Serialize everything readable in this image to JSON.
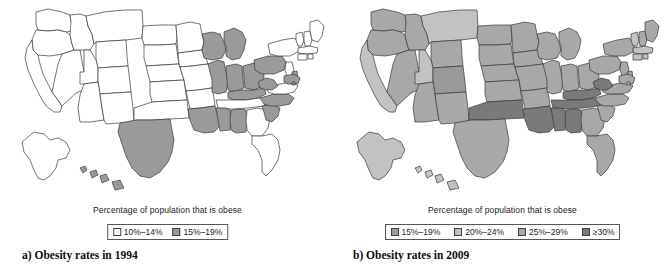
{
  "figure": {
    "panels": [
      {
        "id": "1994",
        "legend_title": "Percentage of population that is obese",
        "caption": "a) Obesity rates in 1994",
        "legend": [
          {
            "label": "10%–14%",
            "color": "#ffffff"
          },
          {
            "label": "15%–19%",
            "color": "#9a9a9a"
          }
        ]
      },
      {
        "id": "2009",
        "legend_title": "Percentage of population that is obese",
        "caption": "b) Obesity rates in 2009",
        "legend": [
          {
            "label": "15%–19%",
            "color": "#9a9a9a"
          },
          {
            "label": "20%–24%",
            "color": "#c2c2c2"
          },
          {
            "label": "25%–29%",
            "color": "#a8a8a8"
          },
          {
            "label": "≥30%",
            "color": "#7a7a7a"
          }
        ]
      }
    ]
  },
  "chart_data": {
    "type": "heatmap",
    "subtitle": "Choropleth maps of percentage of population that is obese",
    "xlabel": "",
    "ylabel": "",
    "grid": false,
    "legend_position": "below-map",
    "maps": [
      {
        "name": "a) Obesity rates in 1994",
        "year": 1994,
        "legend_title": "Percentage of population that is obese",
        "bins": [
          {
            "label": "10%–14%",
            "color": "#ffffff",
            "min": 10,
            "max": 14
          },
          {
            "label": "15%–19%",
            "color": "#9a9a9a",
            "min": 15,
            "max": 19
          }
        ],
        "values": {
          "AL": "15%–19%",
          "AK": "10%–14%",
          "AZ": "10%–14%",
          "AR": "10%–14%",
          "CA": "10%–14%",
          "CO": "10%–14%",
          "CT": "10%–14%",
          "DE": "15%–19%",
          "FL": "10%–14%",
          "GA": "10%–14%",
          "HI": "15%–19%",
          "ID": "10%–14%",
          "IL": "15%–19%",
          "IN": "15%–19%",
          "IA": "10%–14%",
          "KS": "10%–14%",
          "KY": "15%–19%",
          "LA": "15%–19%",
          "ME": "10%–14%",
          "MD": "15%–19%",
          "MA": "10%–14%",
          "MI": "15%–19%",
          "MN": "10%–14%",
          "MS": "15%–19%",
          "MO": "10%–14%",
          "MT": "10%–14%",
          "NE": "10%–14%",
          "NV": "10%–14%",
          "NH": "10%–14%",
          "NJ": "10%–14%",
          "NM": "10%–14%",
          "NY": "10%–14%",
          "NC": "15%–19%",
          "ND": "10%–14%",
          "OH": "15%–19%",
          "OK": "10%–14%",
          "OR": "10%–14%",
          "PA": "15%–19%",
          "RI": "10%–14%",
          "SC": "15%–19%",
          "SD": "10%–14%",
          "TN": "10%–14%",
          "TX": "15%–19%",
          "UT": "10%–14%",
          "VT": "10%–14%",
          "VA": "10%–14%",
          "WA": "10%–14%",
          "WV": "15%–19%",
          "WI": "15%–19%",
          "WY": "10%–14%",
          "DC": "15%–19%"
        }
      },
      {
        "name": "b) Obesity rates in 2009",
        "year": 2009,
        "legend_title": "Percentage of population that is obese",
        "bins": [
          {
            "label": "15%–19%",
            "color": "#9a9a9a",
            "min": 15,
            "max": 19
          },
          {
            "label": "20%–24%",
            "color": "#c2c2c2",
            "min": 20,
            "max": 24
          },
          {
            "label": "25%–29%",
            "color": "#a8a8a8",
            "min": 25,
            "max": 29
          },
          {
            "label": "≥30%",
            "color": "#7a7a7a",
            "min": 30,
            "max": null
          }
        ],
        "values": {
          "AL": "≥30%",
          "AK": "20%–24%",
          "AZ": "25%–29%",
          "AR": "25%–29%",
          "CA": "20%–24%",
          "CO": "15%–19%",
          "CT": "20%–24%",
          "DE": "25%–29%",
          "FL": "25%–29%",
          "GA": "25%–29%",
          "HI": "20%–24%",
          "ID": "25%–29%",
          "IL": "25%–29%",
          "IN": "25%–29%",
          "IA": "25%–29%",
          "KS": "25%–29%",
          "KY": "≥30%",
          "LA": "≥30%",
          "ME": "25%–29%",
          "MD": "25%–29%",
          "MA": "20%–24%",
          "MI": "25%–29%",
          "MN": "25%–29%",
          "MS": "≥30%",
          "MO": "25%–29%",
          "MT": "20%–24%",
          "NE": "25%–29%",
          "NV": "25%–29%",
          "NH": "25%–29%",
          "NJ": "25%–29%",
          "NM": "25%–29%",
          "NY": "25%–29%",
          "NC": "25%–29%",
          "ND": "25%–29%",
          "OH": "25%–29%",
          "OK": "≥30%",
          "OR": "25%–29%",
          "PA": "25%–29%",
          "RI": "20%–24%",
          "SC": "25%–29%",
          "SD": "25%–29%",
          "TN": "≥30%",
          "TX": "25%–29%",
          "UT": "20%–24%",
          "VT": "20%–24%",
          "VA": "25%–29%",
          "WA": "25%–29%",
          "WV": "≥30%",
          "WI": "25%–29%",
          "WY": "25%–29%",
          "DC": "20%–24%"
        }
      }
    ]
  }
}
